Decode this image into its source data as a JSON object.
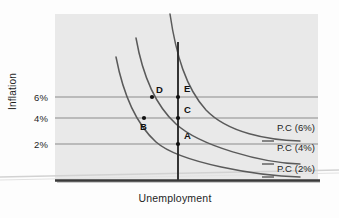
{
  "chart_data": {
    "type": "line",
    "title": "",
    "xlabel": "Unemployment",
    "ylabel": "Inflation",
    "grid": true,
    "legend_position": "right-inline",
    "y_tick_labels": [
      "6%",
      "4%",
      "2%"
    ],
    "y_tick_values": [
      6,
      4,
      2
    ],
    "series": [
      {
        "name": "P.C (6%)",
        "label": "P.C (6%)",
        "description": "Short-run Phillips curve with 6% expected inflation (rightmost)",
        "path": "M 170 14 C 176 55, 186 88, 206 110 C 228 133, 268 140, 300 141"
      },
      {
        "name": "P.C (4%)",
        "label": "P.C (4%)",
        "description": "Short-run Phillips curve with 4% expected inflation (middle)",
        "path": "M 136 38 C 142 72, 154 104, 176 124 C 200 146, 262 163, 300 164"
      },
      {
        "name": "P.C (2%)",
        "label": "P.C (2%)",
        "description": "Short-run Phillips curve with 2% expected inflation (leftmost)",
        "path": "M 116 57 C 122 88, 134 122, 156 142 C 180 163, 258 176, 300 177"
      }
    ],
    "vertical_line": {
      "name": "natural-rate-line",
      "description": "Long-run vertical Phillips curve at the natural rate of unemployment",
      "x": 178,
      "y_top": 42,
      "y_bottom": 181
    },
    "gridlines": [
      {
        "label": "6%",
        "y": 97
      },
      {
        "label": "4%",
        "y": 118
      },
      {
        "label": "2%",
        "y": 144
      }
    ],
    "points": [
      {
        "label": "A",
        "x": 178,
        "y": 144,
        "inflation": "2%",
        "on_curve": "P.C (2%)",
        "label_dx": 6,
        "label_dy": -14
      },
      {
        "label": "B",
        "x": 144,
        "y": 118,
        "inflation": "4%",
        "on_curve": "P.C (2%)",
        "label_dx": -4,
        "label_dy": 3
      },
      {
        "label": "C",
        "x": 178,
        "y": 118,
        "inflation": "4%",
        "on_curve": "P.C (4%)",
        "label_dx": 6,
        "label_dy": -14
      },
      {
        "label": "D",
        "x": 152,
        "y": 97,
        "inflation": "6%",
        "on_curve": "P.C (4%)",
        "label_dx": 4,
        "label_dy": -13
      },
      {
        "label": "E",
        "x": 178,
        "y": 97,
        "inflation": "6%",
        "on_curve": "P.C (6%)",
        "label_dx": 6,
        "label_dy": -14
      }
    ],
    "curve_label_positions": [
      {
        "label": "P.C (6%)",
        "x": 277,
        "y": 128
      },
      {
        "label": "P.C (4%)",
        "x": 277,
        "y": 148
      },
      {
        "label": "P.C (2%)",
        "x": 277,
        "y": 169
      }
    ]
  },
  "axes": {
    "y_title": "Inflation",
    "x_title": "Unemployment",
    "ticks": [
      {
        "label": "6%",
        "top": 92
      },
      {
        "label": "4%",
        "top": 113
      },
      {
        "label": "2%",
        "top": 139
      }
    ]
  },
  "colors": {
    "plot_background": "#e9e9e9",
    "curve": "#5a5a5a",
    "gridline": "#8c8c8c",
    "axis": "#2b2b2b",
    "point": "#111111",
    "text": "#1e1e1e",
    "artifact": "#cfcfcf"
  }
}
